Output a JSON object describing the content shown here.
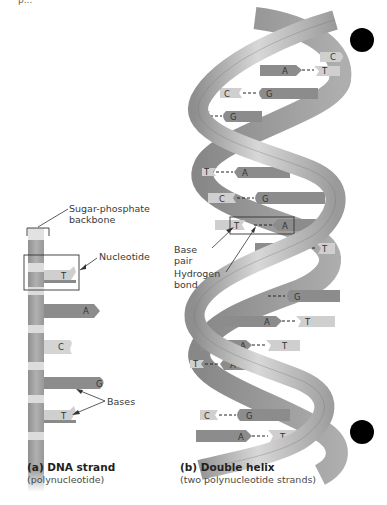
{
  "top_fragment": "p...",
  "panel_a": {
    "title": "(a) DNA strand",
    "subtitle": "(polynucleotide)",
    "labels": {
      "backbone_line1": "Sugar-phosphate",
      "backbone_line2": "backbone",
      "nucleotide": "Nucleotide",
      "bases": "Bases"
    },
    "bases": [
      "T",
      "A",
      "C",
      "G",
      "T"
    ]
  },
  "panel_b": {
    "title": "(b) Double helix",
    "subtitle": "(two polynucleotide strands)",
    "labels": {
      "base_pair_line1": "Base",
      "base_pair_line2": "pair",
      "hbond_line1": "Hydrogen",
      "hbond_line2": "bond"
    },
    "base_pairs": [
      {
        "left": "",
        "right": "C"
      },
      {
        "left": "A",
        "right": "T"
      },
      {
        "left": "C",
        "right": "G"
      },
      {
        "left": "C",
        "right": "G"
      },
      {
        "left": "T",
        "right": "A"
      },
      {
        "left": "C",
        "right": "G"
      },
      {
        "left": "T",
        "right": "A"
      },
      {
        "left": "A",
        "right": "T"
      },
      {
        "left": "",
        "right": "G"
      },
      {
        "left": "A",
        "right": "T"
      },
      {
        "left": "A",
        "right": "T"
      },
      {
        "left": "T",
        "right": "A"
      },
      {
        "left": "C",
        "right": "G"
      },
      {
        "left": "A",
        "right": "T"
      }
    ]
  },
  "colors": {
    "backbone_dark": "#9a9a9a",
    "backbone_light": "#d0d0d0",
    "purine": "#8c8c8c",
    "pyrimidine": "#cfcfcf",
    "marker": "#000000"
  }
}
